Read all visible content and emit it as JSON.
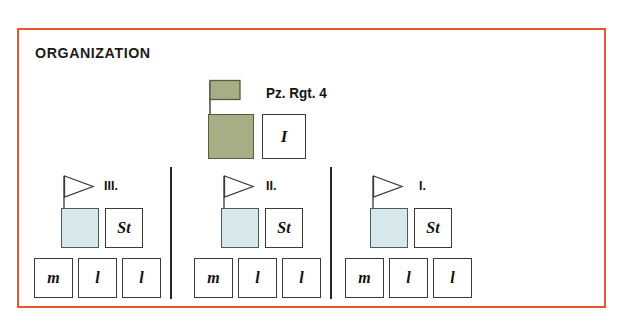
{
  "panel": {
    "title": "ORGANIZATION",
    "border_color": "#e9552f",
    "background_color": "#ffffff"
  },
  "colors": {
    "regiment_fill": "#a9ad85",
    "battalion_fill": "#d6e8ec",
    "company_fill": "#ffffff",
    "outline": "#3a3a3a",
    "separator": "#262626",
    "frame": "#e9552f"
  },
  "regiment": {
    "label": "Pz. Rgt. 4",
    "flag_type": "rectangular-flag",
    "hq_unit_symbol": "",
    "staff_box_label": "I"
  },
  "battalions": [
    {
      "id": "iii",
      "label": "III.",
      "flag_type": "pennant-flag",
      "hq_box_label": "",
      "staff_box_label": "St",
      "companies": [
        {
          "label": "m"
        },
        {
          "label": "l"
        },
        {
          "label": "l"
        }
      ]
    },
    {
      "id": "ii",
      "label": "II.",
      "flag_type": "pennant-flag",
      "hq_box_label": "",
      "staff_box_label": "St",
      "companies": [
        {
          "label": "m"
        },
        {
          "label": "l"
        },
        {
          "label": "l"
        }
      ]
    },
    {
      "id": "i",
      "label": "I.",
      "flag_type": "pennant-flag",
      "hq_box_label": "",
      "staff_box_label": "St",
      "companies": [
        {
          "label": "m"
        },
        {
          "label": "l"
        },
        {
          "label": "l"
        }
      ]
    }
  ]
}
